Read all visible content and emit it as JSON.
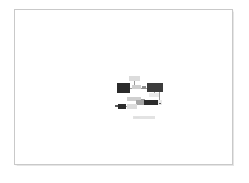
{
  "page": {
    "background_color": "#ffffff",
    "border_color": "#c9c9c9",
    "title": ""
  },
  "diagram": {
    "caption": "Figure",
    "nodes": [
      {
        "id": "n1",
        "label": "",
        "shade": "light2",
        "x": 16,
        "y": 0,
        "w": 11,
        "h": 5
      },
      {
        "id": "n2",
        "label": "",
        "shade": "dark",
        "x": 4,
        "y": 7,
        "w": 13,
        "h": 10
      },
      {
        "id": "n3",
        "label": "",
        "shade": "light",
        "x": 19,
        "y": 9,
        "w": 9,
        "h": 4
      },
      {
        "id": "n4",
        "label": "",
        "shade": "mid",
        "x": 29,
        "y": 10,
        "w": 4,
        "h": 3
      },
      {
        "id": "n5",
        "label": "",
        "shade": "dark2",
        "x": 34,
        "y": 7,
        "w": 16,
        "h": 9
      },
      {
        "id": "n6",
        "label": "",
        "shade": "faint",
        "x": 36,
        "y": 17,
        "w": 10,
        "h": 4
      },
      {
        "id": "n7",
        "label": "",
        "shade": "light",
        "x": 14,
        "y": 21,
        "w": 14,
        "h": 4
      },
      {
        "id": "n8",
        "label": "",
        "shade": "mid2",
        "x": 23,
        "y": 24,
        "w": 9,
        "h": 5
      },
      {
        "id": "n9",
        "label": "",
        "shade": "dark",
        "x": 31,
        "y": 24,
        "w": 14,
        "h": 5
      },
      {
        "id": "n10",
        "label": "",
        "shade": "dark",
        "x": 5,
        "y": 28,
        "w": 8,
        "h": 5
      },
      {
        "id": "n11",
        "label": "",
        "shade": "light2",
        "x": 14,
        "y": 28,
        "w": 10,
        "h": 5
      },
      {
        "id": "n12",
        "label": "",
        "shade": "faint",
        "x": 45,
        "y": 24,
        "w": 4,
        "h": 5
      }
    ],
    "connectors": [
      {
        "orient": "h",
        "x": 17,
        "y": 12,
        "len": 3
      },
      {
        "orient": "h",
        "x": 28,
        "y": 12,
        "len": 2
      },
      {
        "orient": "h",
        "x": 33,
        "y": 12,
        "len": 2
      },
      {
        "orient": "v",
        "x": 21,
        "y": 5,
        "len": 4
      },
      {
        "orient": "v",
        "x": 41,
        "y": 16,
        "len": 2
      },
      {
        "orient": "h",
        "x": 13,
        "y": 30,
        "len": 2
      },
      {
        "orient": "h",
        "x": 24,
        "y": 27,
        "len": 1
      },
      {
        "orient": "h",
        "x": 28,
        "y": 23,
        "len": 4
      },
      {
        "orient": "v",
        "x": 46,
        "y": 16,
        "len": 8
      }
    ],
    "ticks": [
      {
        "x": 2,
        "y": 29,
        "w": 3,
        "h": 2
      },
      {
        "x": 46,
        "y": 27,
        "w": 2,
        "h": 1
      }
    ]
  }
}
